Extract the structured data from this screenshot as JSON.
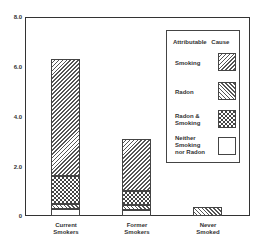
{
  "chart_data": {
    "type": "bar",
    "stacked": true,
    "title": "",
    "xlabel": "",
    "ylabel": "",
    "ylim": [
      0,
      8.0
    ],
    "yticks": [
      "0",
      "2.0",
      "4.0",
      "6.0",
      "8.0"
    ],
    "categories": [
      "Current Smokers",
      "Former Smokers",
      "Never Smoked"
    ],
    "series": [
      {
        "name": "Neither Smoking nor Radon",
        "values": [
          0.3,
          0.25,
          0.0
        ]
      },
      {
        "name": "Radon",
        "values": [
          0.2,
          0.2,
          0.35
        ]
      },
      {
        "name": "Radon & Smoking",
        "values": [
          1.1,
          0.55,
          0.0
        ]
      },
      {
        "name": "Smoking",
        "values": [
          4.7,
          2.1,
          0.0
        ]
      }
    ],
    "totals": [
      6.3,
      3.1,
      0.35
    ],
    "legend": {
      "title": "Attributable Cause",
      "position": "upper right, inside plot",
      "entries": [
        "Smoking",
        "Radon",
        "Radon & Smoking",
        "Neither Smoking nor Radon"
      ]
    },
    "grid": false
  },
  "axis": {
    "y_ticks": [
      {
        "label": "8.0",
        "top": 14
      },
      {
        "label": "6.0",
        "top": 64
      },
      {
        "label": "4.0",
        "top": 114
      },
      {
        "label": "2.0",
        "top": 164
      },
      {
        "label": "0",
        "top": 213
      }
    ]
  },
  "x_labels": [
    {
      "line1": "Current",
      "line2": "Smokers"
    },
    {
      "line1": "Former",
      "line2": "Smokers"
    },
    {
      "line1": "Never",
      "line2": "Smoked"
    }
  ],
  "legend": {
    "title": "Attributable Cause",
    "items": [
      {
        "label": "Smoking"
      },
      {
        "label": "Radon"
      },
      {
        "label": "Radon &\nSmoking"
      },
      {
        "label": "Neither\nSmoking\nnor Radon"
      }
    ]
  }
}
